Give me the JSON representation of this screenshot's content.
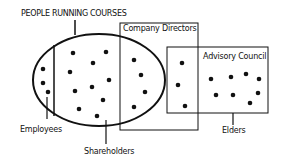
{
  "diagram": {
    "title": "PEOPLE RUNNING COURSES",
    "sets": {
      "company_directors": {
        "label": "Company Directors"
      },
      "advisory_council": {
        "label": "Advisory Council"
      }
    },
    "labels": {
      "employees": "Employees",
      "shareholders": "Shareholders",
      "elders": "Elders"
    },
    "colors": {
      "ink": "#111111",
      "background": "#ffffff"
    }
  }
}
